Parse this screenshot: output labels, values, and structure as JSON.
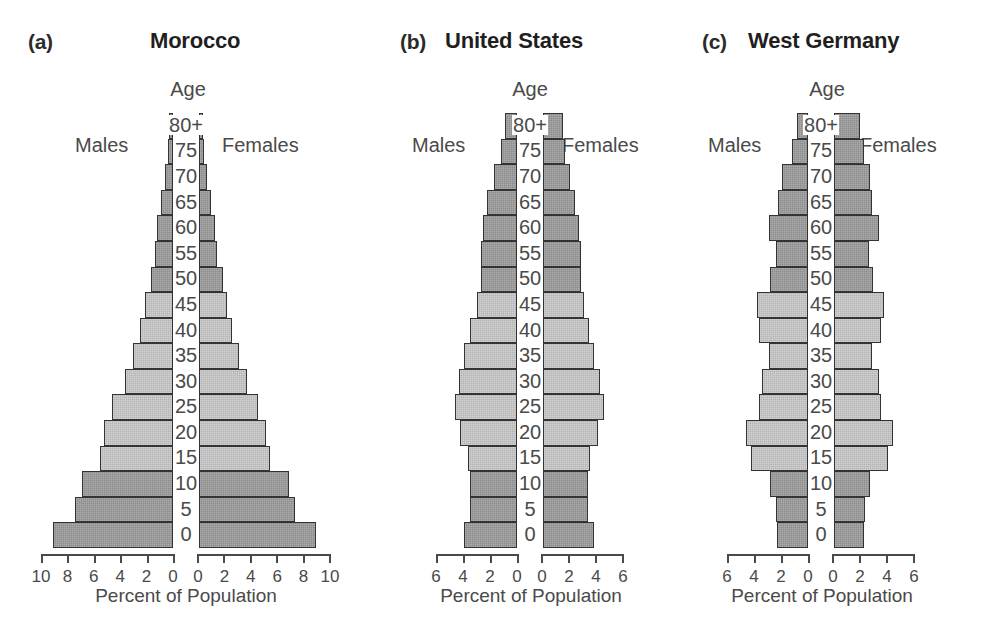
{
  "figure": {
    "axis_title": "Percent of Population",
    "age_axis_label": "Age",
    "males_label": "Males",
    "females_label": "Females",
    "colors": {
      "dark_bar": "#8c8c8c",
      "light_bar": "#b5b5b5",
      "bar_outline": "#333333",
      "text": "#4a4a4a",
      "background": "#ffffff"
    }
  },
  "chart_data": [
    {
      "type": "bar",
      "subtype": "population-pyramid",
      "panel_letter": "(a)",
      "title": "Morocco",
      "xlabel": "Percent of Population",
      "ylabel": "Age",
      "categories": [
        "0",
        "5",
        "10",
        "15",
        "20",
        "25",
        "30",
        "35",
        "40",
        "45",
        "50",
        "55",
        "60",
        "65",
        "70",
        "75",
        "80+"
      ],
      "xlim": [
        0,
        10
      ],
      "xticks": [
        0,
        2,
        4,
        6,
        8,
        10
      ],
      "xticklabels_left": [
        "10",
        "8",
        "6",
        "4",
        "2",
        "0"
      ],
      "xticklabels_right": [
        "0",
        "2",
        "4",
        "6",
        "8",
        "10"
      ],
      "grid": false,
      "legend": [
        "Males",
        "Females"
      ],
      "legend_position": "inside-top",
      "series": [
        {
          "name": "Males",
          "values": [
            9.1,
            7.4,
            6.9,
            5.5,
            5.2,
            4.6,
            3.6,
            3.0,
            2.5,
            2.1,
            1.7,
            1.4,
            1.2,
            0.9,
            0.6,
            0.4,
            0.3
          ]
        },
        {
          "name": "Females",
          "values": [
            8.9,
            7.3,
            6.8,
            5.4,
            5.1,
            4.5,
            3.6,
            3.0,
            2.5,
            2.1,
            1.8,
            1.4,
            1.2,
            0.9,
            0.6,
            0.4,
            0.3
          ]
        }
      ],
      "shading": [
        "dark",
        "dark",
        "dark",
        "light",
        "light",
        "light",
        "light",
        "light",
        "light",
        "light",
        "dark",
        "dark",
        "dark",
        "dark",
        "dark",
        "dark",
        "dark"
      ]
    },
    {
      "type": "bar",
      "subtype": "population-pyramid",
      "panel_letter": "(b)",
      "title": "United States",
      "xlabel": "Percent of Population",
      "ylabel": "Age",
      "categories": [
        "0",
        "5",
        "10",
        "15",
        "20",
        "25",
        "30",
        "35",
        "40",
        "45",
        "50",
        "55",
        "60",
        "65",
        "70",
        "75",
        "80+"
      ],
      "xlim": [
        0,
        6
      ],
      "xticks": [
        0,
        2,
        4,
        6
      ],
      "xticklabels_left": [
        "6",
        "4",
        "2",
        "0"
      ],
      "xticklabels_right": [
        "0",
        "2",
        "4",
        "6"
      ],
      "grid": false,
      "legend": [
        "Males",
        "Females"
      ],
      "legend_position": "inside-top",
      "series": [
        {
          "name": "Males",
          "values": [
            3.9,
            3.5,
            3.5,
            3.6,
            4.2,
            4.6,
            4.3,
            3.9,
            3.5,
            3.0,
            2.7,
            2.7,
            2.5,
            2.2,
            1.7,
            1.2,
            0.9
          ]
        },
        {
          "name": "Females",
          "values": [
            3.8,
            3.3,
            3.3,
            3.5,
            4.1,
            4.5,
            4.2,
            3.8,
            3.4,
            3.0,
            2.8,
            2.8,
            2.7,
            2.4,
            2.0,
            1.6,
            1.5
          ]
        }
      ],
      "shading": [
        "dark",
        "dark",
        "dark",
        "light",
        "light",
        "light",
        "light",
        "light",
        "light",
        "light",
        "dark",
        "dark",
        "dark",
        "dark",
        "dark",
        "dark",
        "dark"
      ]
    },
    {
      "type": "bar",
      "subtype": "population-pyramid",
      "panel_letter": "(c)",
      "title": "West Germany",
      "xlabel": "Percent of Population",
      "ylabel": "Age",
      "categories": [
        "0",
        "5",
        "10",
        "15",
        "20",
        "25",
        "30",
        "35",
        "40",
        "45",
        "50",
        "55",
        "60",
        "65",
        "70",
        "75",
        "80+"
      ],
      "xlim": [
        0,
        6
      ],
      "xticks": [
        0,
        2,
        4,
        6
      ],
      "xticklabels_left": [
        "6",
        "4",
        "2",
        "0"
      ],
      "xticklabels_right": [
        "0",
        "2",
        "4",
        "6"
      ],
      "grid": false,
      "legend": [
        "Males",
        "Females"
      ],
      "legend_position": "inside-top",
      "series": [
        {
          "name": "Males",
          "values": [
            2.3,
            2.4,
            2.8,
            4.2,
            4.6,
            3.6,
            3.4,
            2.9,
            3.6,
            3.8,
            2.8,
            2.4,
            2.9,
            2.2,
            1.9,
            1.2,
            0.8
          ]
        },
        {
          "name": "Females",
          "values": [
            2.2,
            2.3,
            2.7,
            4.0,
            4.4,
            3.5,
            3.3,
            2.8,
            3.5,
            3.7,
            2.9,
            2.6,
            3.3,
            2.8,
            2.7,
            2.2,
            1.9
          ]
        }
      ],
      "shading": [
        "dark",
        "dark",
        "dark",
        "light",
        "light",
        "light",
        "light",
        "light",
        "light",
        "light",
        "dark",
        "dark",
        "dark",
        "dark",
        "dark",
        "dark",
        "dark"
      ]
    }
  ]
}
